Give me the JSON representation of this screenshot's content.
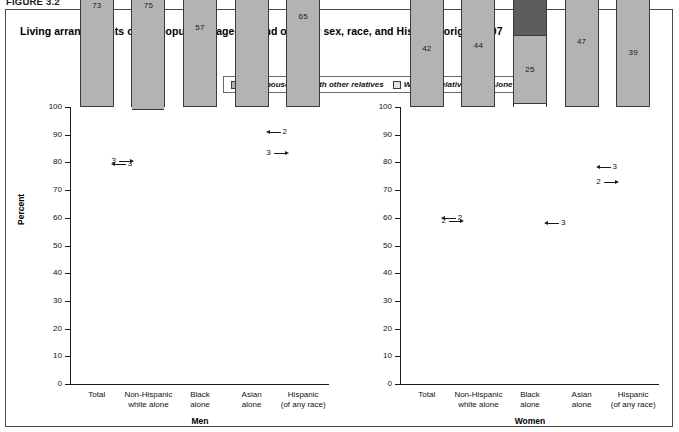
{
  "figure_number": "FIGURE 3.2",
  "title": "Living arrangements of the population aged 65 and over, by sex, race, and Hispanic origin, 2007",
  "legend": {
    "items": [
      {
        "label": "With spouse",
        "key": "with_spouse",
        "color": "#b3b3b3"
      },
      {
        "label": "With other relatives",
        "key": "with_other_relatives",
        "color": "#5d5d5d"
      },
      {
        "label": "With nonrelatives",
        "key": "with_nonrelatives",
        "color": "#e2e2e2"
      },
      {
        "label": "Alone",
        "key": "alone",
        "color": "#4a4a4a"
      }
    ]
  },
  "axis": {
    "ylabel": "Percent",
    "yticks": [
      "100",
      "90",
      "80",
      "70",
      "60",
      "50",
      "40",
      "30",
      "20",
      "10",
      "0"
    ],
    "ymin": 0,
    "ymax": 100
  },
  "panels": [
    {
      "group_label": "Men",
      "categories": [
        {
          "line1": "Total",
          "line2": ""
        },
        {
          "line1": "Non-Hispanic",
          "line2": "white alone"
        },
        {
          "line1": "Black",
          "line2": "alone"
        },
        {
          "line1": "Asian",
          "line2": "alone"
        },
        {
          "line1": "Hispanic",
          "line2": "(of any race)"
        }
      ],
      "bars": [
        {
          "with_spouse": 73,
          "with_other_relatives": 5,
          "with_nonrelatives": 3,
          "alone": 19,
          "callout": {
            "value": "3",
            "segment": "with_nonrelatives",
            "side": "right"
          }
        },
        {
          "with_spouse": 75,
          "with_other_relatives": 4,
          "with_nonrelatives": 3,
          "alone": 19,
          "callout": {
            "value": "3",
            "segment": "with_nonrelatives",
            "side": "left"
          }
        },
        {
          "with_spouse": 57,
          "with_other_relatives": 10,
          "with_nonrelatives": 4,
          "alone": 29,
          "callout": null
        },
        {
          "with_spouse": 84,
          "with_other_relatives": 6,
          "with_nonrelatives": 2,
          "alone": 8,
          "callout": {
            "value": "2",
            "segment": "with_nonrelatives",
            "side": "right"
          }
        },
        {
          "with_spouse": 65,
          "with_other_relatives": 17,
          "with_nonrelatives": 3,
          "alone": 15,
          "callout": {
            "value": "3",
            "segment": "with_nonrelatives",
            "side": "left"
          }
        }
      ]
    },
    {
      "group_label": "Women",
      "categories": [
        {
          "line1": "Total",
          "line2": ""
        },
        {
          "line1": "Non-Hispanic",
          "line2": "white alone"
        },
        {
          "line1": "Black",
          "line2": "alone"
        },
        {
          "line1": "Asian",
          "line2": "alone"
        },
        {
          "line1": "Hispanic",
          "line2": "(of any race)"
        }
      ],
      "bars": [
        {
          "with_spouse": 42,
          "with_other_relatives": 17,
          "with_nonrelatives": 2,
          "alone": 39,
          "callout": {
            "value": "2",
            "segment": "with_nonrelatives",
            "side": "right"
          }
        },
        {
          "with_spouse": 44,
          "with_other_relatives": 14,
          "with_nonrelatives": 2,
          "alone": 40,
          "callout": {
            "value": "2",
            "segment": "with_nonrelatives",
            "side": "left"
          }
        },
        {
          "with_spouse": 25,
          "with_other_relatives": 32,
          "with_nonrelatives": 2,
          "alone": 40,
          "callout": {
            "value": "3",
            "segment": "with_nonrelatives",
            "side": "right"
          }
        },
        {
          "with_spouse": 47,
          "with_other_relatives": 30,
          "with_nonrelatives": 3,
          "alone": 20,
          "callout": {
            "value": "3",
            "segment": "with_nonrelatives",
            "side": "right"
          }
        },
        {
          "with_spouse": 39,
          "with_other_relatives": 33,
          "with_nonrelatives": 2,
          "alone": 26,
          "callout": {
            "value": "2",
            "segment": "with_nonrelatives",
            "side": "left"
          }
        }
      ]
    }
  ],
  "chart_data": {
    "type": "bar",
    "subtype": "stacked-percent",
    "title": "Living arrangements of the population aged 65 and over, by sex, race, and Hispanic origin, 2007",
    "xlabel": "",
    "ylabel": "Percent",
    "ylim": [
      0,
      100
    ],
    "grid": false,
    "legend_position": "top-center",
    "panels": [
      {
        "name": "Men",
        "categories": [
          "Total",
          "Non-Hispanic white alone",
          "Black alone",
          "Asian alone",
          "Hispanic (of any race)"
        ],
        "series": [
          {
            "name": "With spouse",
            "values": [
              73,
              75,
              57,
              84,
              65
            ]
          },
          {
            "name": "With other relatives",
            "values": [
              5,
              4,
              10,
              6,
              17
            ]
          },
          {
            "name": "With nonrelatives",
            "values": [
              3,
              3,
              4,
              2,
              3
            ]
          },
          {
            "name": "Alone",
            "values": [
              19,
              19,
              29,
              8,
              15
            ]
          }
        ]
      },
      {
        "name": "Women",
        "categories": [
          "Total",
          "Non-Hispanic white alone",
          "Black alone",
          "Asian alone",
          "Hispanic (of any race)"
        ],
        "series": [
          {
            "name": "With spouse",
            "values": [
              42,
              44,
              25,
              47,
              39
            ]
          },
          {
            "name": "With other relatives",
            "values": [
              17,
              14,
              32,
              30,
              33
            ]
          },
          {
            "name": "With nonrelatives",
            "values": [
              2,
              2,
              2,
              3,
              2
            ]
          },
          {
            "name": "Alone",
            "values": [
              39,
              40,
              40,
              20,
              26
            ]
          }
        ]
      }
    ]
  }
}
